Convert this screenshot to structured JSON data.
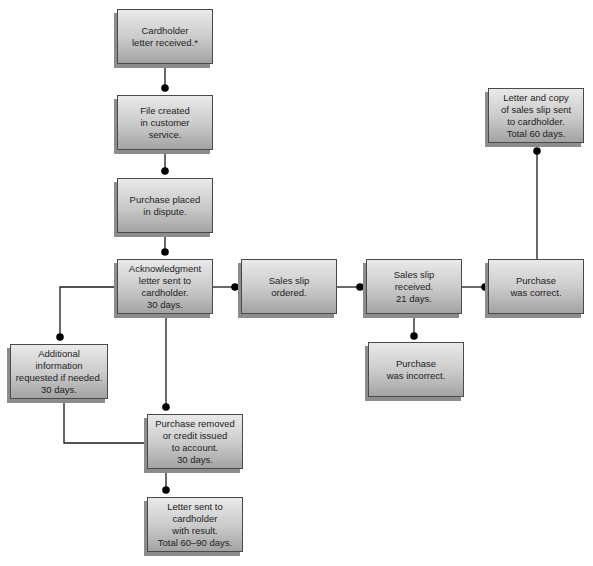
{
  "diagram": {
    "type": "flowchart",
    "nodes": [
      {
        "id": "n1",
        "label": "Cardholder\nletter received.*",
        "x": 117,
        "y": 9,
        "w": 96,
        "h": 55
      },
      {
        "id": "n2",
        "label": "File created\nin customer\nservice.",
        "x": 117,
        "y": 95,
        "w": 96,
        "h": 55
      },
      {
        "id": "n3",
        "label": "Purchase placed\nin dispute.",
        "x": 117,
        "y": 178,
        "w": 96,
        "h": 55
      },
      {
        "id": "n4",
        "label": "Acknowledgment\nletter sent to\ncardholder.\n30 days.",
        "x": 117,
        "y": 259,
        "w": 96,
        "h": 55
      },
      {
        "id": "n5",
        "label": "Sales slip\nordered.",
        "x": 241,
        "y": 259,
        "w": 96,
        "h": 55
      },
      {
        "id": "n6",
        "label": "Sales slip\nreceived.\n21 days.",
        "x": 366,
        "y": 259,
        "w": 96,
        "h": 55
      },
      {
        "id": "n7",
        "label": "Purchase\nwas correct.",
        "x": 488,
        "y": 259,
        "w": 96,
        "h": 55
      },
      {
        "id": "n8",
        "label": "Letter and copy\nof sales slip sent\nto cardholder.\nTotal 60 days.",
        "x": 488,
        "y": 88,
        "w": 96,
        "h": 55
      },
      {
        "id": "n9",
        "label": "Purchase\nwas incorrect.",
        "x": 368,
        "y": 342,
        "w": 96,
        "h": 55
      },
      {
        "id": "n10",
        "label": "Additional\ninformation\nrequested if needed.\n30 days.",
        "x": 10,
        "y": 344,
        "w": 98,
        "h": 55
      },
      {
        "id": "n11",
        "label": "Purchase removed\nor credit issued\nto account.\n30 days.",
        "x": 147,
        "y": 414,
        "w": 96,
        "h": 55
      },
      {
        "id": "n12",
        "label": "Letter sent to\ncardholder\nwith result.\nTotal 60–90 days.",
        "x": 147,
        "y": 497,
        "w": 96,
        "h": 55
      }
    ],
    "edges": [
      {
        "from": "n1",
        "to": "n2",
        "points": [
          [
            165,
            64
          ],
          [
            165,
            88
          ]
        ],
        "dot": [
          165,
          88
        ]
      },
      {
        "from": "n2",
        "to": "n3",
        "points": [
          [
            165,
            150
          ],
          [
            165,
            171
          ]
        ],
        "dot": [
          165,
          171
        ]
      },
      {
        "from": "n3",
        "to": "n4",
        "points": [
          [
            165,
            233
          ],
          [
            165,
            252
          ]
        ],
        "dot": [
          165,
          252
        ]
      },
      {
        "from": "n4",
        "to": "n5",
        "points": [
          [
            213,
            287
          ],
          [
            235,
            287
          ]
        ],
        "dot": [
          235,
          287
        ]
      },
      {
        "from": "n5",
        "to": "n6",
        "points": [
          [
            337,
            287
          ],
          [
            360,
            287
          ]
        ],
        "dot": [
          360,
          287
        ]
      },
      {
        "from": "n6",
        "to": "n7",
        "points": [
          [
            462,
            287
          ],
          [
            485,
            287
          ]
        ],
        "dot": [
          485,
          287
        ]
      },
      {
        "from": "n7",
        "to": "n8",
        "points": [
          [
            537,
            259
          ],
          [
            537,
            151
          ]
        ],
        "dot": [
          537,
          151
        ]
      },
      {
        "from": "n6",
        "to": "n9",
        "points": [
          [
            414,
            314
          ],
          [
            414,
            336
          ]
        ],
        "dot": [
          414,
          336
        ]
      },
      {
        "from": "n4",
        "to": "n10",
        "points": [
          [
            117,
            287
          ],
          [
            60,
            287
          ],
          [
            60,
            337
          ]
        ],
        "dot": [
          60,
          337
        ]
      },
      {
        "from": "n4",
        "to": "n11",
        "points": [
          [
            166,
            314
          ],
          [
            166,
            407
          ]
        ],
        "dot": [
          166,
          407
        ]
      },
      {
        "from": "n10",
        "to": "n11",
        "points": [
          [
            64,
            399
          ],
          [
            64,
            443
          ],
          [
            147,
            443
          ]
        ],
        "dot": null
      },
      {
        "from": "n11",
        "to": "n12",
        "points": [
          [
            166,
            469
          ],
          [
            166,
            490
          ]
        ],
        "dot": [
          166,
          490
        ]
      }
    ],
    "colors": {
      "line": "#1a1a1a",
      "dot": "#000000",
      "box_border": "#4a4a4a",
      "box_shadow": "#8c8c8c",
      "text": "#222222"
    }
  }
}
